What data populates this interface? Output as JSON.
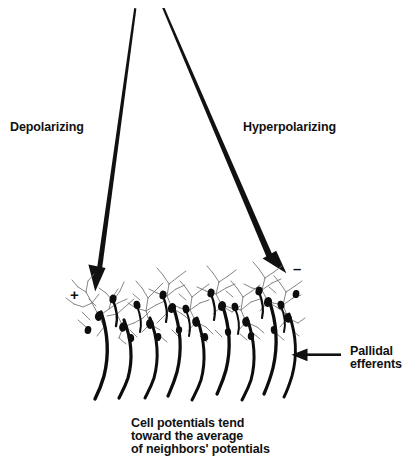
{
  "figure": {
    "title_alt": "Depolarizing and hyperpolarizing inputs onto a sheet of pallidal neurons",
    "background_color": "#ffffff",
    "ink_color": "#111111"
  },
  "labels": {
    "depolarizing": "Depolarizing",
    "hyperpolarizing": "Hyperpolarizing",
    "pallidal_efferents": "Pallidal\nefferents",
    "caption": "Cell potentials tend\ntoward the average\nof neighbors' potentials",
    "caption_lines": [
      "Cell potentials tend",
      "toward the average",
      "of neighbors' potentials"
    ],
    "plus_sign": "+",
    "minus_sign": "–"
  },
  "arrows": [
    {
      "name": "depolarizing-arrow",
      "label": "Depolarizing",
      "sign": "+",
      "from": [
        135,
        9
      ],
      "to": [
        95,
        291
      ],
      "direction": "down-left"
    },
    {
      "name": "hyperpolarizing-arrow",
      "label": "Hyperpolarizing",
      "sign": "–",
      "from": [
        163,
        9
      ],
      "to": [
        286,
        273
      ],
      "direction": "down-right"
    },
    {
      "name": "pallidal-efferents-arrow",
      "label": "Pallidal efferents",
      "from": [
        341,
        355
      ],
      "to": [
        292,
        355
      ],
      "direction": "left"
    }
  ],
  "neuron_layer": {
    "name": "pallidal-neuron-sheet",
    "x_start": 70,
    "x_end": 302,
    "y_top": 276,
    "y_bottom": 345,
    "soma_count": 26,
    "axon_count": 9,
    "soma_color": "#0d0d0d",
    "dendrite_color": "#6f6f6f",
    "axon_color": "#0d0d0d"
  }
}
